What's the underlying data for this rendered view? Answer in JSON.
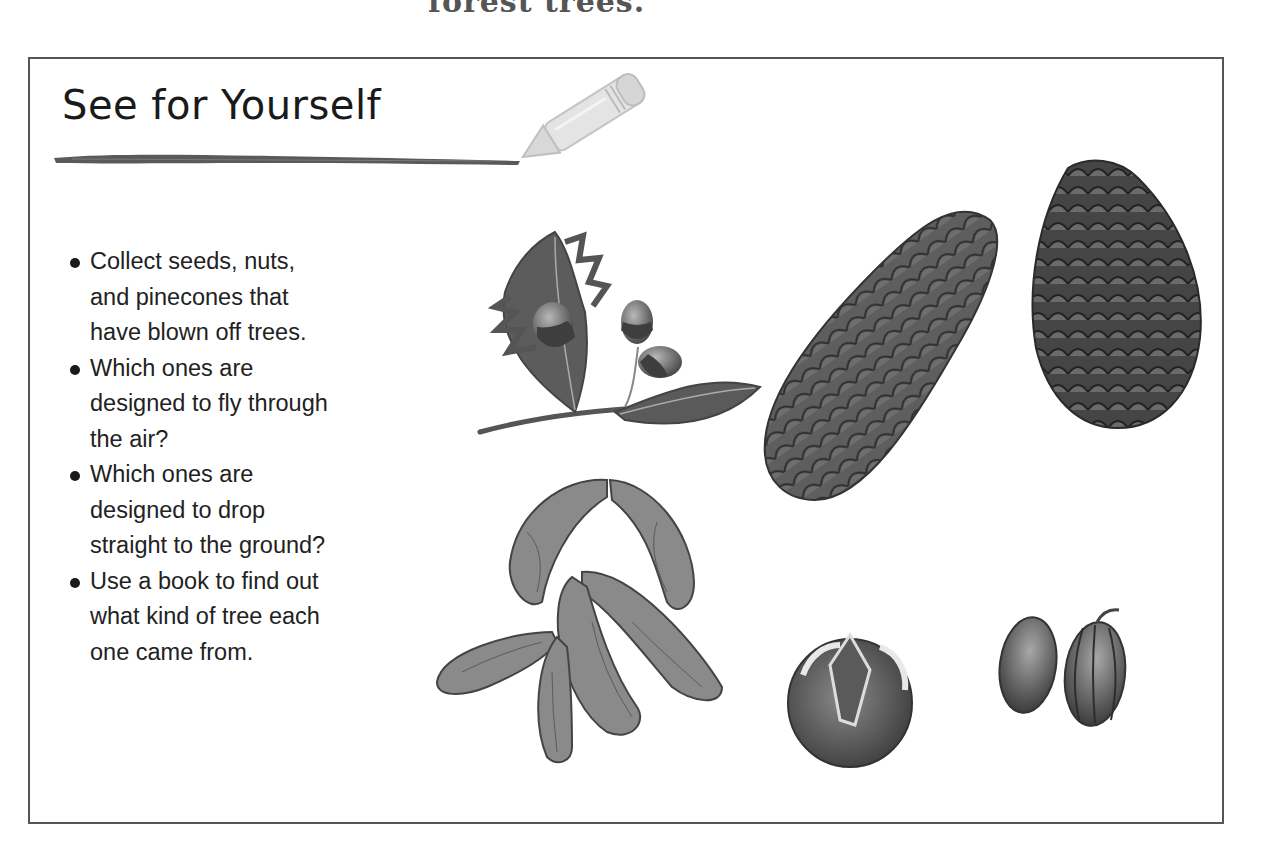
{
  "page": {
    "top_cut_text": "forest trees."
  },
  "panel": {
    "title": "See for Yourself",
    "bullets": [
      {
        "lines": [
          "Collect seeds, nuts,",
          "and pinecones that",
          "have blown off trees."
        ]
      },
      {
        "lines": [
          "Which ones are",
          "designed to fly through",
          "the air?"
        ]
      },
      {
        "lines": [
          "Which ones are",
          "designed to drop",
          "straight to the ground?"
        ]
      },
      {
        "lines": [
          "Use a book to find out",
          "what kind of tree each",
          "one came from."
        ]
      }
    ],
    "illustrations": [
      {
        "name": "oak-leaves-with-acorns"
      },
      {
        "name": "spruce-cone"
      },
      {
        "name": "pine-cone"
      },
      {
        "name": "maple-seeds-samaras"
      },
      {
        "name": "split-husk-nut"
      },
      {
        "name": "pair-of-seeds"
      }
    ],
    "colors": {
      "frame": "#555555",
      "text": "#222222",
      "brush": "#5a5a5a",
      "pencil": "#d0d0d0"
    }
  }
}
